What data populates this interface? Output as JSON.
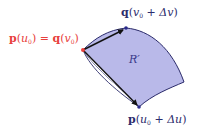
{
  "diagram": {
    "labels": {
      "start": {
        "fn1": "p",
        "var1": "u",
        "sub1": "0",
        "eq": "=",
        "fn2": "q",
        "var2": "v",
        "sub2": "0",
        "color": "#e8403c"
      },
      "top": {
        "fn": "q",
        "var": "v",
        "sub": "0",
        "plus": "+",
        "delta": "Δv",
        "color": "#2c2c6c"
      },
      "bottom": {
        "fn": "p",
        "var": "u",
        "sub": "0",
        "plus": "+",
        "delta": "Δu",
        "color": "#2c2c6c"
      },
      "region": {
        "text": "R′",
        "color": "#3a3a8a"
      }
    },
    "points": {
      "start": {
        "x": 83,
        "y": 50,
        "color": "#e8403c"
      },
      "top": {
        "x": 126,
        "y": 28,
        "color": "#2a2a8a"
      },
      "bottom": {
        "x": 139,
        "y": 107,
        "color": "#2a2a8a"
      },
      "corner": {
        "x": 184,
        "y": 82
      }
    },
    "colors": {
      "fill": "#b9b9e9",
      "stroke": "#2a2a6a",
      "arrow": "#111111"
    }
  }
}
